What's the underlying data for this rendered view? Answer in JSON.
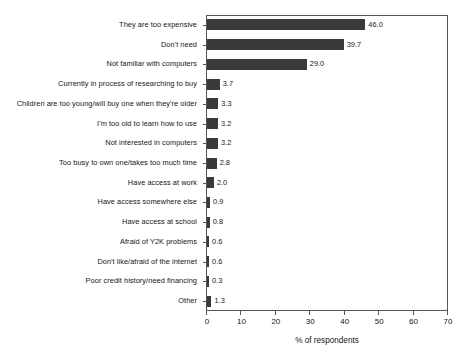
{
  "chart_data": {
    "type": "bar",
    "orientation": "horizontal",
    "title": "",
    "xlabel": "% of respondents",
    "ylabel": "",
    "xlim": [
      0,
      70
    ],
    "xticks": [
      0,
      10,
      20,
      30,
      40,
      50,
      60,
      70
    ],
    "grid": false,
    "legend": null,
    "bar_color": "#3a3a3a",
    "frame_color": "#555555",
    "categories": [
      "They are too expensive",
      "Don't need",
      "Not familiar with computers",
      "Currently in process of researching to buy",
      "Children are too young/will buy one when they're older",
      "I'm too old to learn how to use",
      "Not interested in computers",
      "Too busy to own one/takes too much time",
      "Have access at work",
      "Have access somewhere else",
      "Have access at school",
      "Afraid of Y2K problems",
      "Don't like/afraid of the internet",
      "Poor credit history/need financing",
      "Other"
    ],
    "values": [
      46.0,
      39.7,
      29.0,
      3.7,
      3.3,
      3.2,
      3.2,
      2.8,
      2.0,
      0.9,
      0.8,
      0.6,
      0.6,
      0.3,
      1.3
    ],
    "value_labels": [
      "46.0",
      "39.7",
      "29.0",
      "3.7",
      "3.3",
      "3.2",
      "3.2",
      "2.8",
      "2.0",
      "0.9",
      "0.8",
      "0.6",
      "0.6",
      "0.3",
      "1.3"
    ]
  }
}
